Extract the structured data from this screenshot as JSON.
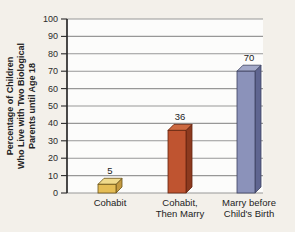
{
  "figure": {
    "background_color": "#f3f0ea",
    "plot_background": "#fcfcfb"
  },
  "chart_data": {
    "type": "bar",
    "title": "",
    "ylabel_lines": [
      "Percentage of Children",
      "Who Live with Two Biological",
      "Parents until Age 18"
    ],
    "categories": [
      [
        "Cohabit"
      ],
      [
        "Cohabit,",
        "Then Marry"
      ],
      [
        "Marry before",
        "Child's Birth"
      ]
    ],
    "values": [
      5,
      36,
      70
    ],
    "value_labels": [
      "5",
      "36",
      "70"
    ],
    "yticks": [
      0,
      10,
      20,
      30,
      40,
      50,
      60,
      70,
      80,
      90,
      100
    ],
    "ylim": [
      0,
      100
    ],
    "grid": true,
    "legend_position": "none",
    "bar_colors": [
      {
        "front": "#e5bd55",
        "top": "#f0da8c",
        "side": "#c49a41",
        "stroke": "#6b5418"
      },
      {
        "front": "#bf5430",
        "top": "#cd6a41",
        "side": "#8c3a1f",
        "stroke": "#64250f"
      },
      {
        "front": "#8b92ba",
        "top": "#a3a9c9",
        "side": "#5f6590",
        "stroke": "#3e425f"
      }
    ],
    "colors": {
      "axis": "#2a2a2a",
      "grid": "#979797",
      "text": "#232323",
      "tick_text": "#2b2b2b"
    }
  }
}
